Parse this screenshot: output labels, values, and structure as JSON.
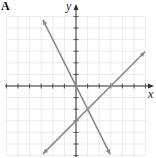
{
  "panel": {
    "label": "A"
  },
  "colors": {
    "grid": "#e6e6e6",
    "axes": "#333333",
    "lines": "#8a8a8a"
  },
  "chart_data": {
    "type": "line",
    "title": "",
    "xlabel": "x",
    "ylabel": "y",
    "xlim": [
      -6,
      6
    ],
    "ylim": [
      -6,
      6
    ],
    "grid": true,
    "tick_step": 1,
    "tick_labels": false,
    "legend": null,
    "series": [
      {
        "name": "y = -2x",
        "slope": -2,
        "intercept": 0,
        "x": [
          -2.85,
          2.95
        ],
        "y": [
          5.7,
          -5.9
        ],
        "arrows": "both"
      },
      {
        "name": "y = x - 3",
        "slope": 1,
        "intercept": -3,
        "x": [
          -2.85,
          5.95
        ],
        "y": [
          -5.85,
          2.95
        ],
        "arrows": "both"
      }
    ],
    "annotations": [
      {
        "type": "intersection",
        "x": 1,
        "y": -2
      },
      {
        "type": "x-intercept",
        "series": "y = x - 3",
        "x": 3,
        "y": 0
      },
      {
        "type": "y-intercept",
        "series": "y = x - 3",
        "x": 0,
        "y": -3
      }
    ]
  }
}
